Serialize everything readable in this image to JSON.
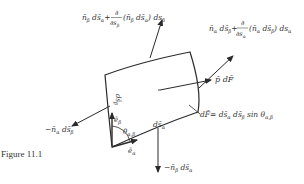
{
  "figure": {
    "caption": "Figure 11.1",
    "labels": {
      "top_left_force": "n̄β ds̄α + ∂/∂sβ (n̄β ds̄α) dsβ",
      "top_right_force": "n̄α ds̄β + ∂/∂sα (n̄α ds̄β) dsα",
      "pressure_force": "p̄ dF̄",
      "area_element": "dF̄ = ds̄α ds̄β sin θα,β",
      "left_force": "−n̄α ds̄β",
      "bottom_force": "−n̄β ds̄α",
      "edge_beta": "ds̄β",
      "edge_alpha": "ds̄α",
      "unit_beta": "ēβ",
      "unit_alpha": "ēα",
      "angle": "θα,β"
    },
    "parts": {
      "tl_n": "n̄",
      "tl_sub1": "β",
      "tl_ds": " ds̄",
      "tl_sub2": "α",
      "tl_plus": "+",
      "tl_frac_num": "∂",
      "tl_frac_den": "∂s",
      "tl_frac_sub": "β",
      "tl_paren": "(n̄",
      "tl_p_sub1": "β",
      "tl_p_ds": " ds̄",
      "tl_p_sub2": "α",
      "tl_close": ") ds",
      "tl_end_sub": "β",
      "tr_n": "n̄",
      "tr_sub1": "α",
      "tr_ds": " ds̄",
      "tr_sub2": "β",
      "tr_plus": "+",
      "tr_frac_num": "∂",
      "tr_frac_den": "∂s",
      "tr_frac_sub": "α",
      "tr_paren": "(n̄",
      "tr_p_sub1": "α",
      "tr_p_ds": " ds̄",
      "tr_p_sub2": "β",
      "tr_close": ") ds",
      "tr_end_sub": "α",
      "p_text": "p̄ dF̄",
      "area_main": "dF̄= ds̄",
      "area_s1": "α",
      "area_mid": " ds̄",
      "area_s2": "β",
      "area_sin": " sin θ",
      "area_s3": "α,β",
      "left_main": "−n̄",
      "left_s1": "α",
      "left_ds": " ds̄",
      "left_s2": "β",
      "bot_main": "−n̄",
      "bot_s1": "β",
      "bot_ds": " ds̄",
      "bot_s2": "α",
      "edge_b_main": "ds̄",
      "edge_b_sub": "β",
      "edge_a_main": "ds̄",
      "edge_a_sub": "α",
      "eb_main": "ē",
      "eb_sub": "β",
      "ea_main": "ē",
      "ea_sub": "α",
      "theta_main": "θ",
      "theta_sub": "α,β"
    },
    "colors": {
      "line": "#2a2a2a",
      "text": "#333333",
      "background": "#ffffff"
    }
  }
}
